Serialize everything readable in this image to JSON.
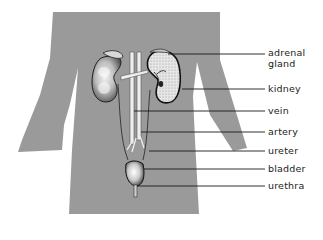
{
  "diagram": {
    "type": "anatomical-labeled-diagram",
    "colors": {
      "background": "#ffffff",
      "body_silhouette": "#9a9a9a",
      "leader_lines": "#1a1a1a",
      "label_text": "#222222"
    },
    "labels": [
      {
        "id": "adrenal-gland",
        "line1": "adrenal",
        "line2": "gland"
      },
      {
        "id": "kidney",
        "line1": "kidney"
      },
      {
        "id": "vein",
        "line1": "vein"
      },
      {
        "id": "artery",
        "line1": "artery"
      },
      {
        "id": "ureter",
        "line1": "ureter"
      },
      {
        "id": "bladder",
        "line1": "bladder"
      },
      {
        "id": "urethra",
        "line1": "urethra"
      }
    ]
  }
}
